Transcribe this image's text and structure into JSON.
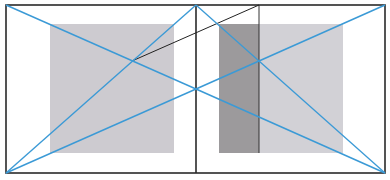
{
  "diagram": {
    "title": "",
    "colors": {
      "background": "#ffffff",
      "frame": "#2a2a2a",
      "guide_line": "#3b9ad6",
      "construction_line": "#222222",
      "light_gray_fill": "#cdcbd0",
      "dark_gray_fill": "#9c9a9c",
      "right_light_fill": "#d2d1d6"
    },
    "frame": {
      "x1": 6,
      "y1": 5,
      "x2": 385,
      "y2": 173
    },
    "center_divider_x": 196,
    "left_panel": {
      "gray_square": {
        "x": 50,
        "y": 24,
        "w": 124,
        "h": 129
      }
    },
    "right_panel": {
      "dark_band": {
        "x": 219,
        "y": 24,
        "w": 40,
        "h": 129
      },
      "light_band": {
        "x": 259,
        "y": 24,
        "w": 84,
        "h": 129
      },
      "vertical_marker": {
        "x": 259,
        "y1": 5,
        "y2": 153
      }
    },
    "guide_lines": [
      {
        "x1": 6,
        "y1": 5,
        "x2": 196,
        "y2": 89
      },
      {
        "x1": 6,
        "y1": 173,
        "x2": 196,
        "y2": 5
      },
      {
        "x1": 6,
        "y1": 173,
        "x2": 196,
        "y2": 89
      },
      {
        "x1": 196,
        "y1": 5,
        "x2": 385,
        "y2": 173
      },
      {
        "x1": 196,
        "y1": 89,
        "x2": 385,
        "y2": 5
      },
      {
        "x1": 196,
        "y1": 89,
        "x2": 385,
        "y2": 173
      }
    ],
    "construction_lines": [
      {
        "x1": 132,
        "y1": 61,
        "x2": 259,
        "y2": 5
      }
    ],
    "intersections": [
      {
        "x": 132,
        "y": 61
      },
      {
        "x": 259,
        "y": 61
      },
      {
        "x": 196,
        "y": 89
      }
    ]
  }
}
